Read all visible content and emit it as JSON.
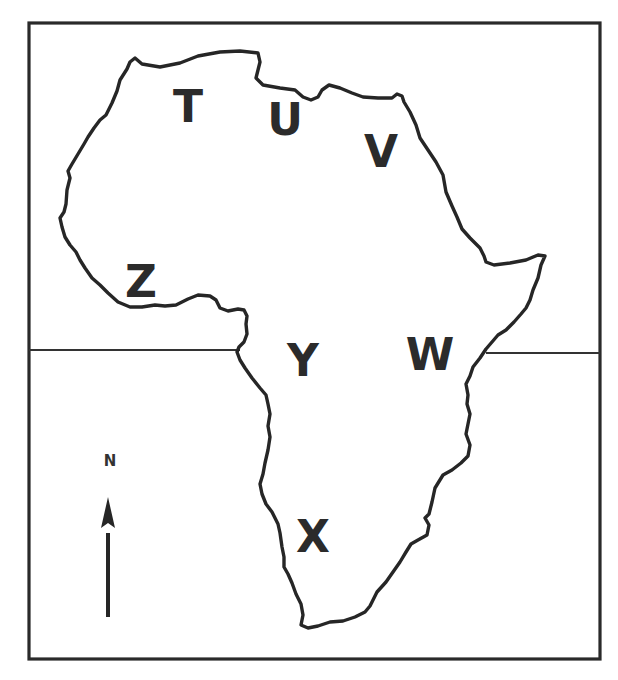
{
  "map": {
    "subject": "Africa outline map",
    "frame": {
      "x": 29,
      "y": 23,
      "width": 571,
      "height": 636
    },
    "equator": {
      "y": 351,
      "left_segment": [
        29,
        240
      ],
      "right_segment": [
        486,
        600
      ]
    },
    "colors": {
      "line": "#262626",
      "background": "#ffffff",
      "label": "#2b2b2b"
    },
    "labels": [
      {
        "id": "T",
        "text": "T",
        "x": 188,
        "y": 107
      },
      {
        "id": "U",
        "text": "U",
        "x": 285,
        "y": 120
      },
      {
        "id": "V",
        "text": "V",
        "x": 381,
        "y": 152
      },
      {
        "id": "Z",
        "text": "Z",
        "x": 141,
        "y": 282
      },
      {
        "id": "Y",
        "text": "Y",
        "x": 303,
        "y": 361
      },
      {
        "id": "W",
        "text": "W",
        "x": 430,
        "y": 355
      },
      {
        "id": "X",
        "text": "X",
        "x": 313,
        "y": 537
      }
    ],
    "north_arrow": {
      "label": "N",
      "label_x": 110,
      "label_y": 461,
      "icon": "north-arrow-icon"
    }
  }
}
